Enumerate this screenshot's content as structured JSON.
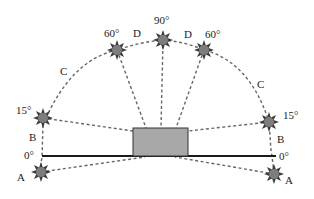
{
  "figure": {
    "sun_positions": [
      {
        "id": "A-left",
        "zone": "A",
        "angle": "0°",
        "side": "left"
      },
      {
        "id": "B-left",
        "zone": "B",
        "angle": "15°",
        "side": "left"
      },
      {
        "id": "C-left-60",
        "zone": "C",
        "angle": "60°",
        "side": "left"
      },
      {
        "id": "top-90",
        "zone": "D",
        "angle": "90°",
        "side": "center"
      },
      {
        "id": "C-right-60",
        "zone": "C",
        "angle": "60°",
        "side": "right"
      },
      {
        "id": "B-right",
        "zone": "B",
        "angle": "15°",
        "side": "right"
      },
      {
        "id": "A-right",
        "zone": "A",
        "angle": "0°",
        "side": "right"
      }
    ],
    "labels": {
      "angle_0_left": "0°",
      "angle_15_left": "15°",
      "angle_60_left": "60°",
      "angle_90": "90°",
      "angle_60_right": "60°",
      "angle_15_right": "15°",
      "angle_0_right": "0°",
      "zone_a_left": "A",
      "zone_b_left": "B",
      "zone_c_left": "C",
      "zone_d_left": "D",
      "zone_d_right": "D",
      "zone_c_right": "C",
      "zone_b_right": "B",
      "zone_a_right": "A"
    },
    "colors": {
      "building": "#a8a8a8",
      "sun_rays": "#3c3c3c",
      "sun_core": "#7d7d7d",
      "path": "#666666",
      "ground": "#1a1a1a"
    }
  }
}
